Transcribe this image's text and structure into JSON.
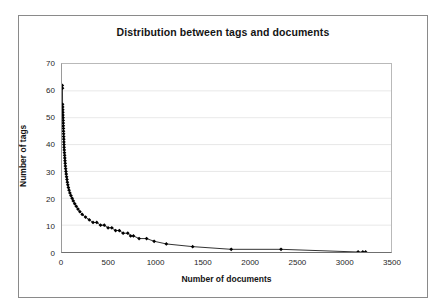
{
  "figure": {
    "title": "Distribution between tags and documents",
    "frame_color": "#8a8a8a",
    "background": "#ffffff"
  },
  "axes": {
    "x_title": "Number of documents",
    "y_title": "Number of tags",
    "x_ticks": [
      "0",
      "500",
      "1000",
      "1500",
      "2000",
      "2500",
      "3000",
      "3500"
    ],
    "y_ticks": [
      "0",
      "10",
      "20",
      "30",
      "40",
      "50",
      "60",
      "70"
    ]
  },
  "chart_data": {
    "type": "line",
    "title": "Distribution between tags and documents",
    "xlabel": "Number of documents",
    "ylabel": "Number of tags",
    "xlim": [
      0,
      3500
    ],
    "ylim": [
      0,
      70
    ],
    "xticks": [
      0,
      500,
      1000,
      1500,
      2000,
      2500,
      3000,
      3500
    ],
    "yticks": [
      0,
      10,
      20,
      30,
      40,
      50,
      60,
      70
    ],
    "grid": "horizontal",
    "legend": "none",
    "marker": "filled-diamond",
    "marker_color": "#000000",
    "line_color": "#1a1a1a",
    "series": [
      {
        "name": "tags vs documents",
        "points": [
          [
            3,
            62
          ],
          [
            5,
            61
          ],
          [
            6,
            55
          ],
          [
            7,
            54
          ],
          [
            8,
            53
          ],
          [
            9,
            52
          ],
          [
            10,
            51
          ],
          [
            11,
            50
          ],
          [
            12,
            49
          ],
          [
            13,
            48
          ],
          [
            14,
            47
          ],
          [
            15,
            46
          ],
          [
            16,
            45
          ],
          [
            17,
            44
          ],
          [
            18,
            43
          ],
          [
            19,
            42
          ],
          [
            20,
            41
          ],
          [
            21,
            40
          ],
          [
            22,
            39
          ],
          [
            24,
            38
          ],
          [
            26,
            37
          ],
          [
            28,
            36
          ],
          [
            30,
            35
          ],
          [
            32,
            34
          ],
          [
            34,
            33
          ],
          [
            36,
            32
          ],
          [
            39,
            31
          ],
          [
            42,
            30
          ],
          [
            45,
            29
          ],
          [
            49,
            28
          ],
          [
            53,
            27
          ],
          [
            57,
            26
          ],
          [
            62,
            25
          ],
          [
            68,
            24
          ],
          [
            75,
            23
          ],
          [
            84,
            22
          ],
          [
            95,
            21
          ],
          [
            108,
            20
          ],
          [
            120,
            19
          ],
          [
            135,
            18
          ],
          [
            152,
            17
          ],
          [
            170,
            16
          ],
          [
            190,
            15
          ],
          [
            215,
            14
          ],
          [
            250,
            13
          ],
          [
            290,
            12
          ],
          [
            330,
            11
          ],
          [
            370,
            11
          ],
          [
            410,
            10
          ],
          [
            450,
            10
          ],
          [
            490,
            9
          ],
          [
            530,
            9
          ],
          [
            570,
            8
          ],
          [
            610,
            8
          ],
          [
            650,
            7
          ],
          [
            700,
            7
          ],
          [
            730,
            6
          ],
          [
            760,
            6
          ],
          [
            820,
            5
          ],
          [
            900,
            5
          ],
          [
            980,
            4
          ],
          [
            1110,
            3
          ],
          [
            1390,
            2
          ],
          [
            1800,
            1
          ],
          [
            2330,
            1
          ],
          [
            3150,
            0
          ],
          [
            3200,
            0
          ],
          [
            3230,
            0
          ]
        ]
      }
    ]
  }
}
